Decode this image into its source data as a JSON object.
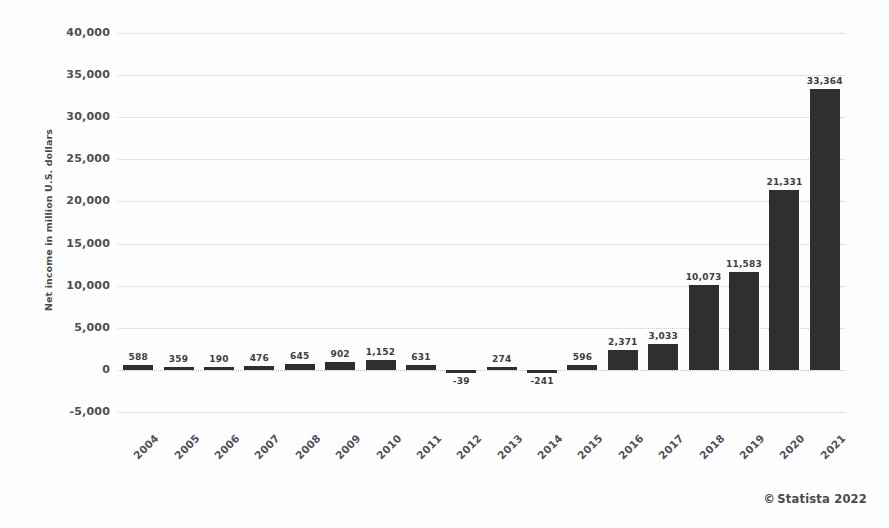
{
  "chart_data": {
    "type": "bar",
    "title": "",
    "xlabel": "",
    "ylabel": "Net income in million U.S. dollars",
    "ylim": [
      -5000,
      40000
    ],
    "ytick_step": 5000,
    "yticks": [
      "40,000",
      "35,000",
      "30,000",
      "25,000",
      "20,000",
      "15,000",
      "10,000",
      "5,000",
      "0",
      "-5,000"
    ],
    "ytick_values": [
      40000,
      35000,
      30000,
      25000,
      20000,
      15000,
      10000,
      5000,
      0,
      -5000
    ],
    "grid": true,
    "legend": "none",
    "categories": [
      "2004",
      "2005",
      "2006",
      "2007",
      "2008",
      "2009",
      "2010",
      "2011",
      "2012",
      "2013",
      "2014",
      "2015",
      "2016",
      "2017",
      "2018",
      "2019",
      "2020",
      "2021"
    ],
    "values": [
      588,
      359,
      190,
      476,
      645,
      902,
      1152,
      631,
      -39,
      274,
      -241,
      596,
      2371,
      3033,
      10073,
      11583,
      21331,
      33364
    ],
    "data_labels": [
      "588",
      "359",
      "190",
      "476",
      "645",
      "902",
      "1,152",
      "631",
      "-39",
      "274",
      "-241",
      "596",
      "2,371",
      "3,033",
      "10,073",
      "11,583",
      "21,331",
      "33,364"
    ],
    "bar_color": "#2f2f2f",
    "grid_color": "#c9c9c9",
    "background_color": "#fefefe"
  },
  "footer": {
    "copyright_symbol": "©",
    "credit": "Statista 2022"
  }
}
